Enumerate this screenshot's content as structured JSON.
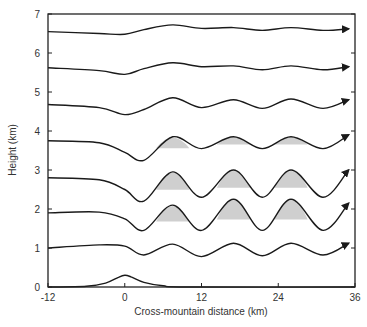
{
  "chart_data": {
    "type": "line",
    "title": "",
    "xlabel": "Cross-mountain distance (km)",
    "ylabel": "Height (km)",
    "xlim": [
      -12,
      36
    ],
    "ylim": [
      0,
      7
    ],
    "xticks": [
      -12,
      0,
      12,
      24,
      36
    ],
    "yticks": [
      0,
      1,
      2,
      3,
      4,
      5,
      6,
      7
    ],
    "grid": false,
    "legend": null,
    "annotations": [
      "arrowheads at right end of each streamline indicating flow direction",
      "shaded regions under wave crests at 2-4 km levels"
    ],
    "terrain": {
      "name": "Mountain",
      "x": [
        -12,
        -6,
        -3,
        -1,
        0,
        1,
        3,
        6,
        10,
        36
      ],
      "y": [
        0,
        0.02,
        0.1,
        0.25,
        0.3,
        0.26,
        0.12,
        0.03,
        0.0,
        0.0
      ]
    },
    "series": [
      {
        "name": "Streamline 1 km",
        "base": 1.0,
        "x": [
          -12,
          -4,
          0,
          3,
          7.5,
          12,
          17,
          21.5,
          26,
          31,
          35
        ],
        "y": [
          1.0,
          1.08,
          1.05,
          0.82,
          1.1,
          0.78,
          1.12,
          0.8,
          1.12,
          0.82,
          1.12
        ],
        "shaded": false
      },
      {
        "name": "Streamline 2 km",
        "base": 1.9,
        "x": [
          -12,
          -4,
          0,
          3,
          7.5,
          12,
          17,
          21.5,
          26,
          31,
          35
        ],
        "y": [
          1.9,
          1.92,
          1.75,
          1.45,
          2.1,
          1.45,
          2.25,
          1.45,
          2.25,
          1.45,
          2.15
        ],
        "shaded": true
      },
      {
        "name": "Streamline 3 km",
        "base": 2.8,
        "x": [
          -12,
          -4,
          0,
          3,
          7.5,
          12,
          17,
          21.5,
          26,
          31,
          35
        ],
        "y": [
          2.8,
          2.75,
          2.5,
          2.2,
          2.95,
          2.3,
          3.0,
          2.3,
          3.0,
          2.3,
          3.0
        ],
        "shaded": true
      },
      {
        "name": "Streamline 4 km",
        "base": 3.7,
        "x": [
          -12,
          -4,
          0,
          3,
          7.5,
          12,
          17,
          21.5,
          26,
          31,
          35
        ],
        "y": [
          3.75,
          3.7,
          3.45,
          3.25,
          3.85,
          3.55,
          3.85,
          3.55,
          3.85,
          3.55,
          3.9
        ],
        "shaded": true
      },
      {
        "name": "Streamline 5 km",
        "base": 4.65,
        "x": [
          -12,
          -4,
          0,
          3,
          7.5,
          12,
          17,
          21.5,
          26,
          31,
          35
        ],
        "y": [
          4.68,
          4.6,
          4.42,
          4.55,
          4.85,
          4.6,
          4.8,
          4.58,
          4.82,
          4.58,
          4.8
        ],
        "shaded": false
      },
      {
        "name": "Streamline 6 km",
        "base": 5.6,
        "x": [
          -12,
          -4,
          0,
          3,
          7.5,
          12,
          17,
          21.5,
          26,
          31,
          35
        ],
        "y": [
          5.62,
          5.55,
          5.45,
          5.6,
          5.75,
          5.65,
          5.67,
          5.57,
          5.67,
          5.57,
          5.65
        ],
        "shaded": false
      },
      {
        "name": "Streamline 7 km",
        "base": 6.55,
        "x": [
          -12,
          -4,
          0,
          3,
          7.5,
          12,
          17,
          21.5,
          26,
          31,
          35
        ],
        "y": [
          6.55,
          6.5,
          6.48,
          6.6,
          6.72,
          6.63,
          6.65,
          6.58,
          6.65,
          6.58,
          6.62
        ],
        "shaded": false
      }
    ]
  },
  "axes": {
    "xlabel": "Cross-mountain distance (km)",
    "ylabel": "Height (km)",
    "xtick_labels": [
      "-12",
      "0",
      "12",
      "24",
      "36"
    ],
    "ytick_labels": [
      "0",
      "1",
      "2",
      "3",
      "4",
      "5",
      "6",
      "7"
    ]
  },
  "colors": {
    "line": "#1a1a1a",
    "shade": "#cfcfcf",
    "frame": "#222222",
    "text": "#333333"
  }
}
